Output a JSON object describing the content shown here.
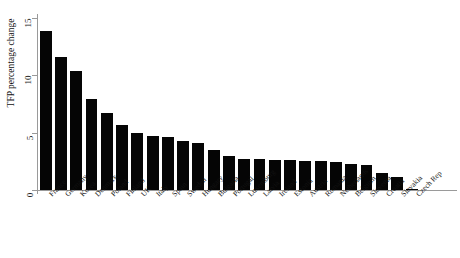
{
  "chart_data": {
    "type": "bar",
    "title": "",
    "xlabel": "",
    "ylabel": "TFP percentage change",
    "ylim": [
      0,
      15
    ],
    "yticks": [
      0,
      5,
      10,
      15
    ],
    "ytick_labels": [
      "0",
      "5",
      "10",
      "15"
    ],
    "grid": false,
    "legend": "none",
    "orientation": "vertical",
    "bar_color": "#050505",
    "axis_color": "#9a9a9a",
    "categories": [
      "France",
      "Germany",
      "Korea",
      "Denmark",
      "Poland",
      "Finland",
      "UK",
      "Italy",
      "Spain",
      "Sweden",
      "Hungary",
      "Bulgaria",
      "Portugal",
      "Luxemburg",
      "Latvia",
      "Ireland",
      "Estonia",
      "Austria",
      "Romania",
      "Netherlands",
      "Belgium",
      "Slovenia",
      "Croatia",
      "Slovakia",
      "Czech Rep"
    ],
    "values": [
      13.9,
      11.6,
      10.4,
      7.9,
      6.7,
      5.7,
      5.0,
      4.7,
      4.6,
      4.3,
      4.1,
      3.5,
      3.0,
      2.7,
      2.7,
      2.6,
      2.6,
      2.5,
      2.5,
      2.4,
      2.3,
      2.2,
      1.5,
      1.1,
      0.05
    ],
    "series": [
      {
        "name": "TFP percentage change",
        "values": [
          13.9,
          11.6,
          10.4,
          7.9,
          6.7,
          5.7,
          5.0,
          4.7,
          4.6,
          4.3,
          4.1,
          3.5,
          3.0,
          2.7,
          2.7,
          2.6,
          2.6,
          2.5,
          2.5,
          2.4,
          2.3,
          2.2,
          1.5,
          1.1,
          0.05
        ]
      }
    ]
  }
}
